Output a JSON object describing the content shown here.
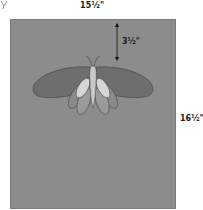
{
  "diagram": {
    "width_label": "15½\"",
    "height_label": "16½\"",
    "drop_label": "3½\"",
    "colors": {
      "background": "#8c8c8c",
      "forewing": "#6e6e6e",
      "hindwing": "#9a9a9a",
      "inner_wing": "#d6d6d6",
      "body": "#c8c8c8",
      "outline": "#4a4a4a"
    }
  }
}
